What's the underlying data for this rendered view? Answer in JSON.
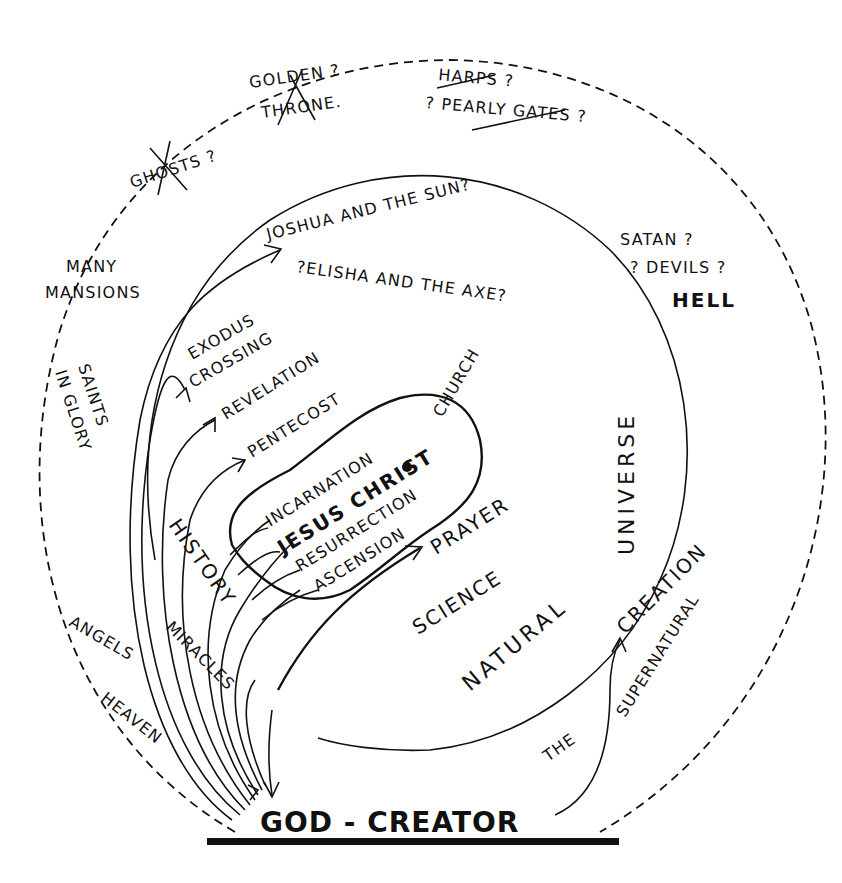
{
  "diagram": {
    "outer_ring_labels": {
      "ghosts": "GHOSTS ?",
      "golden": "GOLDEN ?",
      "throne": "THRONE.",
      "harps": "HARPS ?",
      "pearly_gates": "? PEARLY GATES ?",
      "many": "MANY",
      "mansions": "MANSIONS",
      "saints": "SAINTS",
      "in_glory": "IN GLORY",
      "satan": "SATAN ?",
      "devils": "? DEVILS ?",
      "hell": "HELL",
      "angels": "ANGELS",
      "heaven": "HEAVEN",
      "supernatural": "SUPERNATURAL",
      "the": "THE"
    },
    "inner_ring_labels": {
      "joshua": "JOSHUA AND THE SUN?",
      "elisha": "?ELISHA AND THE AXE?",
      "exodus": "EXODUS",
      "crossing": "CROSSING",
      "revelation": "REVELATION",
      "pentecost": "PENTECOST",
      "church": "CHURCH",
      "universe": "UNIVERSE",
      "prayer": "PRAYER",
      "science": "SCIENCE",
      "natural": "NATURAL",
      "creation": "CREATION",
      "history": "HISTORY",
      "miracles": "MIRACLES"
    },
    "core_labels": {
      "incarnation": "INCARNATION",
      "jesus_christ": "JESUS CHRIST",
      "resurrection": "RESURRECTION",
      "ascension": "ASCENSION"
    },
    "base_label": "GOD - CREATOR",
    "crossed_out_items": [
      "GHOSTS",
      "GOLDEN THRONE",
      "HARPS",
      "PEARLY GATES"
    ]
  }
}
